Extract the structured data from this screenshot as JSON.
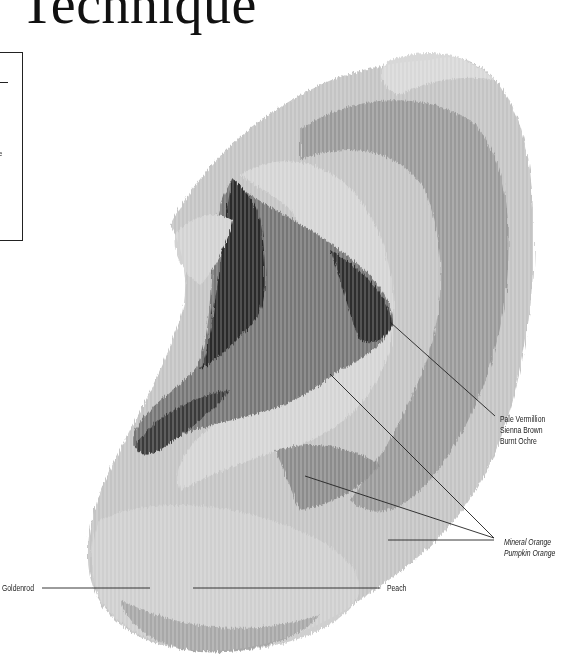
{
  "page": {
    "title": "Technique",
    "sidebox": {
      "fragment_text": "e"
    }
  },
  "illustration": {
    "subject": "ear-colored-pencil-drawing",
    "palette": {
      "dark": "#1e1e1e",
      "mid_dark": "#5a5a5a",
      "mid": "#8a8a8a",
      "light": "#b8b8b8",
      "pale": "#d6d6d6"
    }
  },
  "callouts": [
    {
      "id": "pale-vermilion-group",
      "lines": [
        "Pale Vermillion",
        "Sienna Brown",
        "Burnt Ochre"
      ]
    },
    {
      "id": "mineral-orange-group",
      "lines": [
        "Mineral Orange",
        "Pumpkin Orange"
      ]
    },
    {
      "id": "goldenrod",
      "lines": [
        "Goldenrod"
      ]
    },
    {
      "id": "peach",
      "lines": [
        "Peach"
      ]
    }
  ]
}
